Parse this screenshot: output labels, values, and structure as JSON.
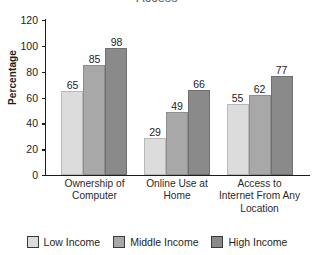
{
  "chart_data": {
    "type": "bar",
    "title": "Access",
    "xlabel": "",
    "ylabel": "Percentage",
    "ylim": [
      0,
      120
    ],
    "yticks": [
      0,
      20,
      40,
      60,
      80,
      100,
      120
    ],
    "grid": false,
    "legend_position": "bottom",
    "categories": [
      "Ownership of Computer",
      "Online Use at Home",
      "Access to Internet From Any Location"
    ],
    "category_lines": [
      [
        "Ownership of",
        "Computer"
      ],
      [
        "Online Use at",
        "Home"
      ],
      [
        "Access to",
        "Internet From Any",
        "Location"
      ]
    ],
    "series": [
      {
        "name": "Low Income",
        "color": "#dcdcdc",
        "values": [
          65,
          29,
          55
        ]
      },
      {
        "name": "Middle Income",
        "color": "#a8a8a8",
        "values": [
          85,
          49,
          62
        ]
      },
      {
        "name": "High Income",
        "color": "#8a8a8a",
        "values": [
          98,
          66,
          77
        ]
      }
    ]
  },
  "legend": {
    "items": [
      {
        "label": "Low Income"
      },
      {
        "label": "Middle Income"
      },
      {
        "label": "High Income"
      }
    ]
  },
  "axis": {
    "y_tick_labels": [
      "120",
      "100",
      "80",
      "60",
      "40",
      "20",
      "0"
    ]
  }
}
